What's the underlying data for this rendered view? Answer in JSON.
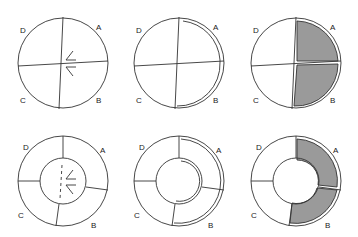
{
  "diagram": {
    "colors": {
      "stroke": "#333333",
      "shade": "#9a9a9a",
      "background": "#ffffff"
    },
    "panels": [
      {
        "id": "circle-symmetry",
        "shape": "circle",
        "labels": [
          "A",
          "B",
          "C",
          "D"
        ],
        "marks": "angle glyphs at center"
      },
      {
        "id": "circle-arc-highlight",
        "shape": "circle",
        "labels": [
          "A",
          "B",
          "C",
          "D"
        ],
        "marks": "double arc along A-B boundary"
      },
      {
        "id": "circle-shaded",
        "shape": "circle",
        "labels": [
          "A",
          "B",
          "C",
          "D"
        ],
        "shaded": [
          "A",
          "B"
        ]
      },
      {
        "id": "annulus-symmetry",
        "shape": "annulus",
        "labels": [
          "A",
          "B",
          "C",
          "D"
        ],
        "marks": "dashed axis with angle glyphs in hole"
      },
      {
        "id": "annulus-arc-highlight",
        "shape": "annulus",
        "labels": [
          "A",
          "B",
          "C",
          "D"
        ],
        "marks": "double arcs along A-B outer and inner boundary"
      },
      {
        "id": "annulus-shaded",
        "shape": "annulus",
        "labels": [
          "A",
          "B",
          "C",
          "D"
        ],
        "shaded": [
          "A",
          "B"
        ]
      }
    ],
    "labels": {
      "a": "A",
      "b": "B",
      "c": "C",
      "d": "D"
    }
  }
}
